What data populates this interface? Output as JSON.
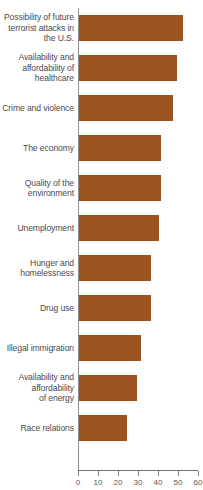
{
  "chart_data": {
    "type": "bar",
    "orientation": "horizontal",
    "title": "",
    "subtitle": "",
    "xlabel": "",
    "ylabel": "",
    "xlim": [
      0,
      60
    ],
    "grid": false,
    "legend": null,
    "bar_color": "#9c5221",
    "axis_color": "#7d7d7d",
    "label_color": "#4b4b4d",
    "xticks": [
      0,
      10,
      20,
      30,
      40,
      50,
      60
    ],
    "xtick_labels": [
      "0",
      "10",
      "20",
      "30",
      "40",
      "50",
      "60"
    ],
    "categories": [
      "Possibility of future terrorist attacks in the U.S.",
      "Availability and affordability of healthcare",
      "Crime and violence",
      "The economy",
      "Quality of the environment",
      "Unemployment",
      "Hunger and homelessness",
      "Drug use",
      "Illegal immigration",
      "Availability and affordability of energy",
      "Race relations"
    ],
    "category_lines": [
      [
        "Possibility of future",
        "terrorist attacks in",
        "the U.S."
      ],
      [
        "Availability and",
        "affordability of",
        "healthcare"
      ],
      [
        "Crime and violence"
      ],
      [
        "The economy"
      ],
      [
        "Quality of the",
        "environment"
      ],
      [
        "Unemployment"
      ],
      [
        "Hunger and",
        "homelessness"
      ],
      [
        "Drug use"
      ],
      [
        "Illegal immigration"
      ],
      [
        "Availability and",
        "affordability",
        "of energy"
      ],
      [
        "Race relations"
      ]
    ],
    "values": [
      52,
      49,
      47,
      41,
      41,
      40,
      36,
      36,
      31,
      29,
      24
    ]
  }
}
